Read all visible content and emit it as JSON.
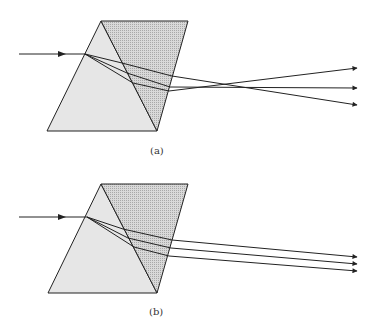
{
  "colors": {
    "prism_left_fill": "#e6e6e6",
    "prism_right_fill": "#d6d6d6",
    "dot_color": "#a8a8a8",
    "line": "#222222"
  },
  "panels": [
    {
      "id": "a",
      "caption": "(a)",
      "caption_pos": [
        150,
        145
      ],
      "prism_left": [
        [
          101,
          21
        ],
        [
          157,
          131
        ],
        [
          47,
          131
        ]
      ],
      "prism_right": [
        [
          101,
          21
        ],
        [
          188,
          21
        ],
        [
          157,
          131
        ]
      ],
      "incoming": {
        "from": [
          19,
          54
        ],
        "to": [
          85,
          54
        ],
        "arrow_at": [
          64,
          54
        ]
      },
      "rays": [
        {
          "points": [
            [
              85,
              54
            ],
            [
              122,
              63
            ],
            [
              172,
              76
            ],
            [
              357,
              105
            ]
          ]
        },
        {
          "points": [
            [
              85,
              54
            ],
            [
              127,
              73
            ],
            [
              170,
              87
            ],
            [
              357,
              88
            ]
          ]
        },
        {
          "points": [
            [
              85,
              54
            ],
            [
              133,
              83
            ],
            [
              169,
              91
            ],
            [
              357,
              68
            ]
          ]
        }
      ]
    },
    {
      "id": "b",
      "caption": "(b)",
      "caption_pos": [
        149,
        306
      ],
      "prism_left": [
        [
          101,
          184
        ],
        [
          157,
          293
        ],
        [
          48,
          293
        ]
      ],
      "prism_right": [
        [
          101,
          184
        ],
        [
          188,
          184
        ],
        [
          157,
          293
        ]
      ],
      "incoming": {
        "from": [
          19,
          217
        ],
        "to": [
          87,
          217
        ],
        "arrow_at": [
          64,
          217
        ]
      },
      "rays": [
        {
          "points": [
            [
              87,
              217
            ],
            [
              123,
              229
            ],
            [
              172,
              240
            ],
            [
              357,
              257
            ]
          ]
        },
        {
          "points": [
            [
              87,
              217
            ],
            [
              128,
              238
            ],
            [
              171,
              248
            ],
            [
              357,
              264
            ]
          ]
        },
        {
          "points": [
            [
              87,
              217
            ],
            [
              134,
              247
            ],
            [
              169,
              256
            ],
            [
              357,
              271
            ]
          ]
        }
      ]
    }
  ]
}
